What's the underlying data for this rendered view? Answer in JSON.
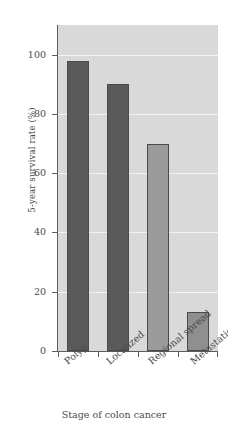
{
  "chart_data": {
    "type": "bar",
    "title": "",
    "subtitle": "",
    "xlabel": "Stage of colon cancer",
    "ylabel": "5-year survival rate (%)",
    "categories": [
      "Polyp",
      "Localized",
      "Regional spread",
      "Metastatic"
    ],
    "values": [
      98,
      90,
      70,
      13
    ],
    "bar_colors": [
      "#5a5a5a",
      "#5a5a5a",
      "#9b9b9b",
      "#8f8f8f"
    ],
    "bar_edge_color": "#4a4a4a",
    "ylim": [
      0,
      110
    ],
    "yticks": [
      0,
      20,
      40,
      60,
      80,
      100
    ],
    "ytick_labels": [
      "0",
      "20",
      "40",
      "60",
      "80",
      "100"
    ],
    "xtick_label_rotation": -40,
    "grid": true,
    "grid_color": "#f2f2f2",
    "plot_background": "#d9d9d9",
    "figure_background": "#ffffff",
    "axis_color": "#5c5c5c",
    "legend": null,
    "legend_position": "none",
    "annotations": []
  }
}
